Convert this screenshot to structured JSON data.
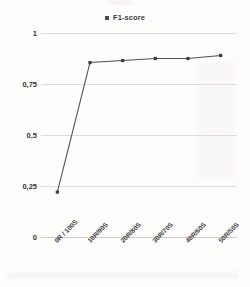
{
  "chart_data": {
    "type": "line",
    "title": "",
    "xlabel": "",
    "ylabel": "",
    "categories": [
      "0R / 100S",
      "10R/90S",
      "20R/80S",
      "30R/70S",
      "40R/60S",
      "50R/50S"
    ],
    "series": [
      {
        "name": "F1-score",
        "values": [
          0.22,
          0.855,
          0.865,
          0.875,
          0.875,
          0.89
        ]
      }
    ],
    "ylim": [
      0,
      1
    ],
    "yticks": [
      0,
      0.25,
      0.5,
      0.75,
      1
    ],
    "ytick_labels": [
      "0",
      "0,25",
      "0,5",
      "0,75",
      "1"
    ],
    "grid": true,
    "legend_position": "top-center",
    "marker": "square",
    "line_color": "#4f4f4f",
    "grid_color": "#dedbd8"
  },
  "legend": {
    "entries": [
      {
        "label": "F1-score",
        "marker_icon": "square-marker-icon",
        "color": "#4a4a4a"
      }
    ]
  }
}
